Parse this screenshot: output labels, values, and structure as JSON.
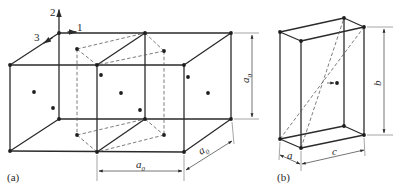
{
  "figure": {
    "panel_a": {
      "label": "(a)",
      "axes": {
        "axis_1": "1",
        "axis_2": "2",
        "axis_3": "3"
      },
      "dim_vertical": {
        "base": "a",
        "sub": "0"
      },
      "dim_horizontal": {
        "base": "a",
        "sub": "0"
      },
      "dim_depth": {
        "base": "a",
        "sub": "0"
      }
    },
    "panel_b": {
      "label": "(b)",
      "dim_a": "a",
      "dim_b": "b",
      "dim_c": "c"
    }
  },
  "colors": {
    "line": "#2b2b2b",
    "dashed": "#5a5a5a",
    "background": "#ffffff"
  }
}
